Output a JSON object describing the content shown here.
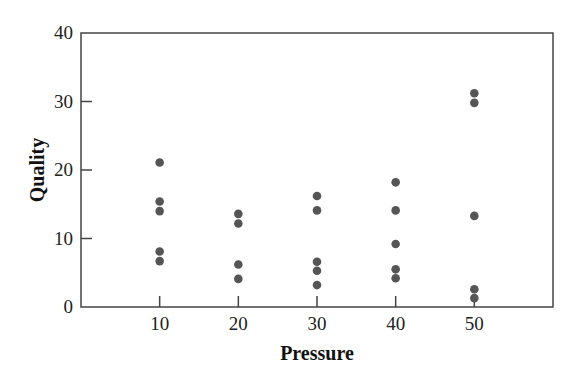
{
  "chart_data": {
    "type": "scatter",
    "title": "",
    "xlabel": "Pressure",
    "ylabel": "Quality",
    "xlim": [
      0,
      60
    ],
    "ylim": [
      0,
      40
    ],
    "x_ticks": [
      10,
      20,
      30,
      40,
      50
    ],
    "y_ticks": [
      0,
      10,
      20,
      30,
      40
    ],
    "grid": false,
    "legend": null,
    "marker_color": "#555555",
    "series": [
      {
        "name": "Quality vs Pressure",
        "points": [
          {
            "x": 10,
            "y": 21.1
          },
          {
            "x": 10,
            "y": 15.4
          },
          {
            "x": 10,
            "y": 14.0
          },
          {
            "x": 10,
            "y": 8.1
          },
          {
            "x": 10,
            "y": 6.7
          },
          {
            "x": 20,
            "y": 13.6
          },
          {
            "x": 20,
            "y": 12.2
          },
          {
            "x": 20,
            "y": 6.2
          },
          {
            "x": 20,
            "y": 4.1
          },
          {
            "x": 30,
            "y": 16.2
          },
          {
            "x": 30,
            "y": 14.1
          },
          {
            "x": 30,
            "y": 6.6
          },
          {
            "x": 30,
            "y": 5.3
          },
          {
            "x": 30,
            "y": 3.2
          },
          {
            "x": 40,
            "y": 18.2
          },
          {
            "x": 40,
            "y": 14.1
          },
          {
            "x": 40,
            "y": 9.2
          },
          {
            "x": 40,
            "y": 5.5
          },
          {
            "x": 40,
            "y": 4.2
          },
          {
            "x": 50,
            "y": 31.2
          },
          {
            "x": 50,
            "y": 29.8
          },
          {
            "x": 50,
            "y": 13.3
          },
          {
            "x": 50,
            "y": 2.6
          },
          {
            "x": 50,
            "y": 1.3
          }
        ]
      }
    ]
  }
}
